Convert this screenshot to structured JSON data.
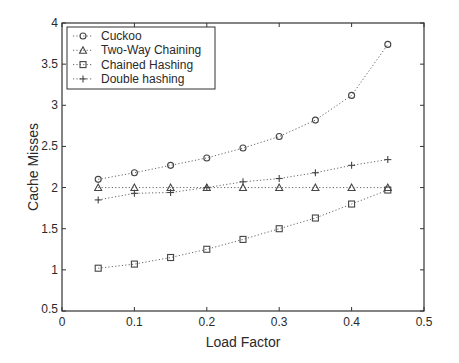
{
  "chart_data": {
    "type": "line",
    "title": "",
    "xlabel": "Load Factor",
    "ylabel": "Cache Misses",
    "xlim": [
      0,
      0.5
    ],
    "ylim": [
      0.5,
      4
    ],
    "xticks": [
      "0",
      "0.1",
      "0.2",
      "0.3",
      "0.4",
      "0.5"
    ],
    "yticks": [
      "0.5",
      "1",
      "1.5",
      "2",
      "2.5",
      "3",
      "3.5",
      "4"
    ],
    "grid": false,
    "legend_position": "upper left",
    "x": [
      0.05,
      0.1,
      0.15,
      0.2,
      0.25,
      0.3,
      0.35,
      0.4,
      0.45
    ],
    "series": [
      {
        "name": "Cuckoo",
        "marker": "circle",
        "values": [
          2.1,
          2.18,
          2.27,
          2.36,
          2.48,
          2.62,
          2.82,
          3.12,
          3.74
        ]
      },
      {
        "name": "Two-Way Chaining",
        "marker": "triangle",
        "values": [
          2.0,
          2.0,
          2.0,
          2.0,
          2.0,
          2.0,
          2.0,
          2.0,
          2.0
        ]
      },
      {
        "name": "Chained Hashing",
        "marker": "square",
        "values": [
          1.02,
          1.07,
          1.15,
          1.25,
          1.37,
          1.5,
          1.63,
          1.8,
          1.97
        ]
      },
      {
        "name": "Double hashing",
        "marker": "plus",
        "values": [
          1.85,
          1.93,
          1.94,
          2.0,
          2.07,
          2.11,
          2.18,
          2.27,
          2.34
        ]
      }
    ]
  }
}
